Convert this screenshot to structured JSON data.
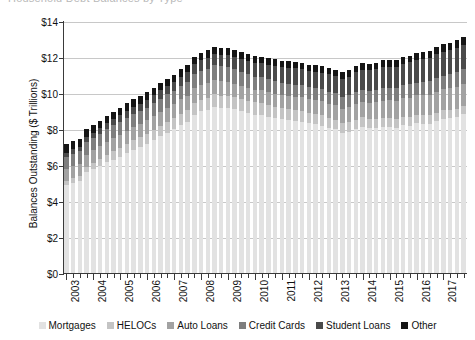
{
  "title": {
    "clipped_text": "Household Debt Balances by Type"
  },
  "chart_data": {
    "type": "bar",
    "stacked": true,
    "title": "",
    "xlabel": "",
    "ylabel": "Balances Outstanding ($ Trillions)",
    "ylim": [
      0,
      14
    ],
    "ytick_labels": [
      "$0",
      "$2",
      "$4",
      "$6",
      "$8",
      "$10",
      "$12",
      "$14"
    ],
    "ytick_values": [
      0,
      2,
      4,
      6,
      8,
      10,
      12,
      14
    ],
    "grid": "horizontal",
    "legend_position": "bottom",
    "x_tick_labels": [
      "2003",
      "2004",
      "2005",
      "2006",
      "2007",
      "2008",
      "2009",
      "2010",
      "2011",
      "2012",
      "2013",
      "2014",
      "2015",
      "2016",
      "2017"
    ],
    "x_period": "quarterly",
    "categories": [
      "2003Q1",
      "2003Q2",
      "2003Q3",
      "2003Q4",
      "2004Q1",
      "2004Q2",
      "2004Q3",
      "2004Q4",
      "2005Q1",
      "2005Q2",
      "2005Q3",
      "2005Q4",
      "2006Q1",
      "2006Q2",
      "2006Q3",
      "2006Q4",
      "2007Q1",
      "2007Q2",
      "2007Q3",
      "2007Q4",
      "2008Q1",
      "2008Q2",
      "2008Q3",
      "2008Q4",
      "2009Q1",
      "2009Q2",
      "2009Q3",
      "2009Q4",
      "2010Q1",
      "2010Q2",
      "2010Q3",
      "2010Q4",
      "2011Q1",
      "2011Q2",
      "2011Q3",
      "2011Q4",
      "2012Q1",
      "2012Q2",
      "2012Q3",
      "2012Q4",
      "2013Q1",
      "2013Q2",
      "2013Q3",
      "2013Q4",
      "2014Q1",
      "2014Q2",
      "2014Q3",
      "2014Q4",
      "2015Q1",
      "2015Q2",
      "2015Q3",
      "2015Q4",
      "2016Q1",
      "2016Q2",
      "2016Q3",
      "2016Q4",
      "2017Q1",
      "2017Q2",
      "2017Q3",
      "2017Q4"
    ],
    "series": [
      {
        "name": "Mortgages",
        "color": "#e2e2e2",
        "values": [
          4.94,
          5.08,
          5.18,
          5.66,
          5.84,
          6.01,
          6.21,
          6.36,
          6.51,
          6.7,
          6.88,
          7.05,
          7.22,
          7.43,
          7.65,
          7.86,
          8.03,
          8.28,
          8.46,
          8.86,
          9.03,
          9.12,
          9.29,
          9.22,
          9.21,
          9.14,
          9.04,
          8.96,
          8.86,
          8.84,
          8.74,
          8.65,
          8.6,
          8.54,
          8.49,
          8.46,
          8.37,
          8.33,
          8.25,
          8.12,
          8.03,
          7.84,
          7.9,
          8.05,
          8.17,
          8.1,
          8.13,
          8.17,
          8.17,
          8.12,
          8.26,
          8.25,
          8.37,
          8.36,
          8.35,
          8.48,
          8.63,
          8.69,
          8.74,
          8.88
        ]
      },
      {
        "name": "HELOCs",
        "color": "#c4c4c4",
        "values": [
          0.24,
          0.25,
          0.27,
          0.29,
          0.34,
          0.38,
          0.42,
          0.47,
          0.5,
          0.53,
          0.55,
          0.56,
          0.57,
          0.58,
          0.6,
          0.61,
          0.62,
          0.63,
          0.64,
          0.65,
          0.66,
          0.68,
          0.69,
          0.69,
          0.69,
          0.68,
          0.68,
          0.68,
          0.67,
          0.66,
          0.65,
          0.64,
          0.63,
          0.62,
          0.61,
          0.6,
          0.59,
          0.57,
          0.56,
          0.56,
          0.55,
          0.54,
          0.53,
          0.53,
          0.53,
          0.52,
          0.51,
          0.51,
          0.51,
          0.5,
          0.49,
          0.49,
          0.49,
          0.48,
          0.47,
          0.47,
          0.46,
          0.45,
          0.45,
          0.44
        ]
      },
      {
        "name": "Auto Loans",
        "color": "#a2a2a2",
        "values": [
          0.64,
          0.66,
          0.67,
          0.68,
          0.7,
          0.71,
          0.72,
          0.73,
          0.73,
          0.74,
          0.74,
          0.73,
          0.74,
          0.75,
          0.76,
          0.77,
          0.78,
          0.79,
          0.8,
          0.81,
          0.81,
          0.81,
          0.81,
          0.79,
          0.78,
          0.76,
          0.75,
          0.71,
          0.7,
          0.7,
          0.7,
          0.71,
          0.71,
          0.72,
          0.73,
          0.75,
          0.75,
          0.77,
          0.78,
          0.78,
          0.79,
          0.81,
          0.83,
          0.86,
          0.88,
          0.9,
          0.93,
          0.96,
          0.97,
          1.0,
          1.03,
          1.06,
          1.07,
          1.1,
          1.14,
          1.16,
          1.17,
          1.18,
          1.21,
          1.22
        ]
      },
      {
        "name": "Credit Cards",
        "color": "#7e7e7e",
        "values": [
          0.69,
          0.69,
          0.69,
          0.7,
          0.7,
          0.7,
          0.71,
          0.72,
          0.72,
          0.72,
          0.72,
          0.73,
          0.72,
          0.72,
          0.72,
          0.74,
          0.74,
          0.75,
          0.76,
          0.79,
          0.79,
          0.8,
          0.81,
          0.84,
          0.81,
          0.79,
          0.76,
          0.77,
          0.73,
          0.73,
          0.73,
          0.73,
          0.69,
          0.69,
          0.69,
          0.7,
          0.68,
          0.67,
          0.67,
          0.68,
          0.66,
          0.67,
          0.67,
          0.68,
          0.66,
          0.67,
          0.68,
          0.7,
          0.68,
          0.7,
          0.71,
          0.73,
          0.71,
          0.73,
          0.75,
          0.78,
          0.76,
          0.78,
          0.81,
          0.83
        ]
      },
      {
        "name": "Student Loans",
        "color": "#4a4a4a",
        "values": [
          0.24,
          0.25,
          0.26,
          0.27,
          0.28,
          0.29,
          0.31,
          0.33,
          0.36,
          0.37,
          0.39,
          0.39,
          0.43,
          0.45,
          0.47,
          0.48,
          0.51,
          0.52,
          0.54,
          0.55,
          0.58,
          0.6,
          0.62,
          0.64,
          0.66,
          0.68,
          0.71,
          0.73,
          0.76,
          0.78,
          0.81,
          0.85,
          0.87,
          0.89,
          0.92,
          0.87,
          0.9,
          0.91,
          0.93,
          0.97,
          0.99,
          1.0,
          1.03,
          1.08,
          1.11,
          1.12,
          1.13,
          1.16,
          1.19,
          1.19,
          1.2,
          1.23,
          1.26,
          1.26,
          1.28,
          1.31,
          1.34,
          1.34,
          1.36,
          1.38
        ]
      },
      {
        "name": "Other",
        "color": "#151515",
        "values": [
          0.46,
          0.46,
          0.45,
          0.44,
          0.43,
          0.43,
          0.42,
          0.42,
          0.42,
          0.42,
          0.42,
          0.41,
          0.41,
          0.41,
          0.41,
          0.4,
          0.4,
          0.4,
          0.4,
          0.41,
          0.41,
          0.41,
          0.4,
          0.4,
          0.39,
          0.38,
          0.38,
          0.38,
          0.37,
          0.36,
          0.36,
          0.36,
          0.35,
          0.35,
          0.35,
          0.36,
          0.35,
          0.35,
          0.35,
          0.35,
          0.34,
          0.34,
          0.35,
          0.36,
          0.36,
          0.36,
          0.36,
          0.37,
          0.36,
          0.36,
          0.37,
          0.38,
          0.38,
          0.38,
          0.39,
          0.4,
          0.4,
          0.4,
          0.41,
          0.41
        ]
      }
    ]
  },
  "legend": {
    "items": [
      {
        "label": "Mortgages",
        "color": "#e2e2e2"
      },
      {
        "label": "HELOCs",
        "color": "#c4c4c4"
      },
      {
        "label": "Auto Loans",
        "color": "#a2a2a2"
      },
      {
        "label": "Credit Cards",
        "color": "#7e7e7e"
      },
      {
        "label": "Student Loans",
        "color": "#4a4a4a"
      },
      {
        "label": "Other",
        "color": "#151515"
      }
    ]
  }
}
